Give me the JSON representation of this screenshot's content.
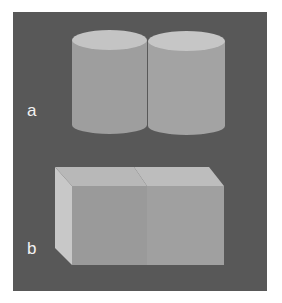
{
  "figure": {
    "panels": [
      {
        "label": "a",
        "shape": "two adjacent cylinders"
      },
      {
        "label": "b",
        "shape": "two adjacent cubes"
      }
    ]
  },
  "colors": {
    "background": "#585858",
    "page": "#ffffff",
    "label": "#f2f2f2",
    "cylinder_top": "#c4c4c4",
    "cylinder_body": "#9e9e9e",
    "cube_top": "#b8b8b8",
    "cube_side": "#c8c8c8",
    "cube_front": "#9a9a9a"
  }
}
